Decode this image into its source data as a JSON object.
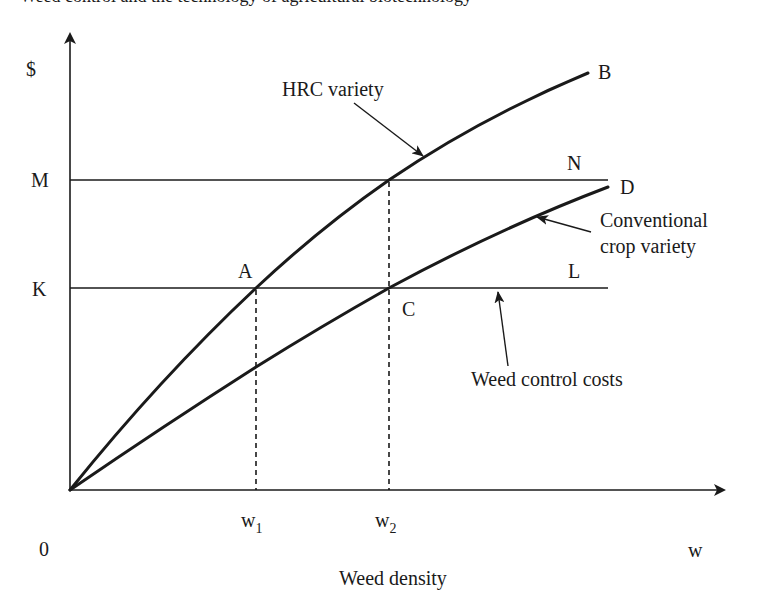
{
  "header": {
    "text": "Weed control and the technology of agricultural biotechnology"
  },
  "axes": {
    "y_label": "$",
    "x_label": "w",
    "x_title": "Weed density",
    "origin_label": "0",
    "y_ticks": [
      {
        "label": "M"
      },
      {
        "label": "K"
      }
    ],
    "x_ticks": [
      {
        "base": "w",
        "sub": "1"
      },
      {
        "base": "w",
        "sub": "2"
      }
    ]
  },
  "curves": {
    "hrc": {
      "end_label": "B",
      "annotation": "HRC variety"
    },
    "conventional": {
      "end_label": "D",
      "annotation_line1": "Conventional",
      "annotation_line2": "crop variety"
    }
  },
  "lines": {
    "m_line": {
      "end_label": "N"
    },
    "k_line": {
      "end_label": "L",
      "annotation": "Weed control costs"
    }
  },
  "points": {
    "a": "A",
    "c": "C"
  },
  "colors": {
    "ink": "#1a1a1a",
    "background": "#ffffff"
  }
}
